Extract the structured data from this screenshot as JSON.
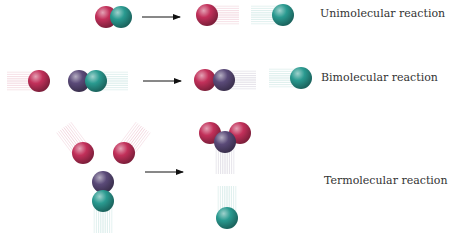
{
  "colors": {
    "red": "#c2305a",
    "teal": "#2a9a90",
    "purple": "#5a4a78",
    "arrow": "#111111"
  },
  "rows": [
    {
      "id": "unimolecular",
      "label": "Unimolecular reaction",
      "label_pos": [
        320,
        7
      ],
      "arrow": [
        142,
        17,
        180,
        17
      ],
      "reactants": [
        {
          "color": "red",
          "x": 106,
          "y": 17,
          "r": 11
        },
        {
          "color": "teal",
          "x": 121,
          "y": 17,
          "r": 11
        }
      ],
      "products": [
        {
          "color": "red",
          "x": 207,
          "y": 15,
          "r": 11,
          "trail": "right"
        },
        {
          "color": "teal",
          "x": 283,
          "y": 15,
          "r": 11,
          "trail": "left"
        }
      ]
    },
    {
      "id": "bimolecular",
      "label": "Bimolecular reaction",
      "label_pos": [
        321,
        71
      ],
      "arrow": [
        143,
        81,
        181,
        81
      ],
      "reactants": [
        {
          "color": "red",
          "x": 39,
          "y": 81,
          "r": 11,
          "trail": "left"
        },
        {
          "color": "purple",
          "x": 79,
          "y": 81,
          "r": 11
        },
        {
          "color": "teal",
          "x": 96,
          "y": 81,
          "r": 11,
          "trail": "right"
        }
      ],
      "products": [
        {
          "color": "red",
          "x": 205,
          "y": 80,
          "r": 11
        },
        {
          "color": "purple",
          "x": 224,
          "y": 80,
          "r": 11,
          "trail": "right"
        },
        {
          "color": "teal",
          "x": 301,
          "y": 78,
          "r": 11,
          "trail": "left"
        }
      ]
    },
    {
      "id": "termolecular",
      "label": "Termolecular reaction",
      "label_pos": [
        324,
        174
      ],
      "arrow": [
        145,
        172,
        183,
        172
      ],
      "reactants": [
        {
          "color": "red",
          "x": 83,
          "y": 153,
          "r": 11,
          "trail": "up-left"
        },
        {
          "color": "red",
          "x": 124,
          "y": 153,
          "r": 11,
          "trail": "up-right"
        },
        {
          "color": "purple",
          "x": 103,
          "y": 182,
          "r": 11
        },
        {
          "color": "teal",
          "x": 103,
          "y": 201,
          "r": 11,
          "trail": "down"
        }
      ],
      "products": [
        {
          "color": "red",
          "x": 210,
          "y": 133,
          "r": 11
        },
        {
          "color": "red",
          "x": 240,
          "y": 133,
          "r": 11
        },
        {
          "color": "purple",
          "x": 225,
          "y": 142,
          "r": 11,
          "trail": "down"
        },
        {
          "color": "teal",
          "x": 227,
          "y": 218,
          "r": 11,
          "trail": "up"
        }
      ]
    }
  ]
}
